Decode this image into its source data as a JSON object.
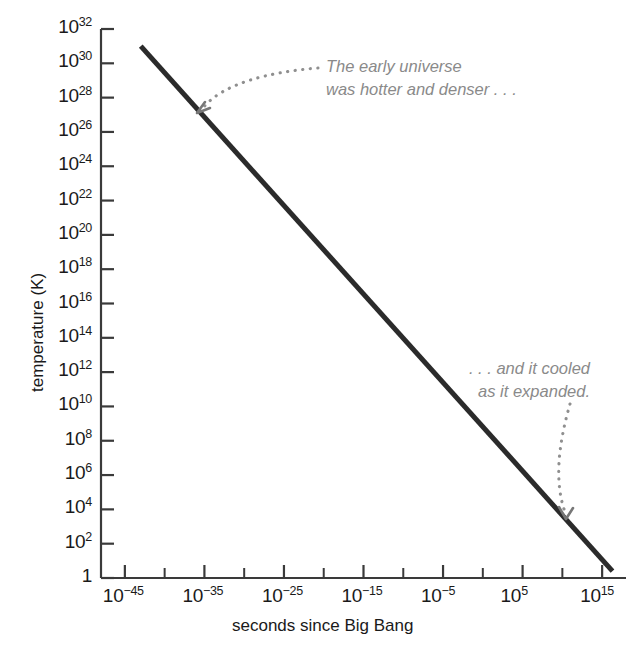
{
  "chart_data": {
    "type": "line",
    "title": "",
    "subtitle": "",
    "xlabel": "seconds since Big Bang",
    "ylabel": "temperature (K)",
    "xscale": "log",
    "yscale": "log",
    "grid": false,
    "legend": "none",
    "xlim_exponent": [
      -48,
      18
    ],
    "ylim_exponent": [
      0,
      32
    ],
    "x_tick_labels": [
      {
        "base": "10",
        "exp": "−45",
        "exponent_value": -45
      },
      {
        "base": "10",
        "exp": "−35",
        "exponent_value": -35
      },
      {
        "base": "10",
        "exp": "−25",
        "exponent_value": -25
      },
      {
        "base": "10",
        "exp": "−15",
        "exponent_value": -15
      },
      {
        "base": "10",
        "exp": "−5",
        "exponent_value": -5
      },
      {
        "base": "10",
        "exp": "5",
        "exponent_value": 5
      },
      {
        "base": "10",
        "exp": "15",
        "exponent_value": 15
      }
    ],
    "x_minor_tick_exponents": [
      -40,
      -30,
      -20,
      -10,
      0,
      10
    ],
    "y_tick_labels": [
      {
        "base": "10",
        "exp": "32",
        "exponent_value": 32
      },
      {
        "base": "10",
        "exp": "30",
        "exponent_value": 30
      },
      {
        "base": "10",
        "exp": "28",
        "exponent_value": 28
      },
      {
        "base": "10",
        "exp": "26",
        "exponent_value": 26
      },
      {
        "base": "10",
        "exp": "24",
        "exponent_value": 24
      },
      {
        "base": "10",
        "exp": "22",
        "exponent_value": 22
      },
      {
        "base": "10",
        "exp": "20",
        "exponent_value": 20
      },
      {
        "base": "10",
        "exp": "18",
        "exponent_value": 18
      },
      {
        "base": "10",
        "exp": "16",
        "exponent_value": 16
      },
      {
        "base": "10",
        "exp": "14",
        "exponent_value": 14
      },
      {
        "base": "10",
        "exp": "12",
        "exponent_value": 12
      },
      {
        "base": "10",
        "exp": "10",
        "exponent_value": 10
      },
      {
        "base": "10",
        "exp": "8",
        "exponent_value": 8
      },
      {
        "base": "10",
        "exp": "6",
        "exponent_value": 6
      },
      {
        "base": "10",
        "exp": "4",
        "exponent_value": 4
      },
      {
        "base": "10",
        "exp": "2",
        "exponent_value": 2
      },
      {
        "base": "1",
        "exp": "",
        "exponent_value": 0
      }
    ],
    "series": [
      {
        "name": "temperature vs time",
        "color": "#2b2b2b",
        "linewidth": 5,
        "points_log10": [
          {
            "x": -43.0,
            "y": 31.0
          },
          {
            "x": 16.3,
            "y": 0.4
          }
        ],
        "points_readable": [
          {
            "time_s": "1e-43",
            "temperature_K": "1e31"
          },
          {
            "time_s": "1e16",
            "temperature_K": "~2.5"
          }
        ]
      }
    ],
    "annotations": [
      {
        "id": "early-universe",
        "lines": [
          "The early universe",
          "was hotter and denser . . ."
        ],
        "text": "The early universe was hotter and denser . . .",
        "color": "#8a8a8a",
        "style": "italic",
        "arrow": "dotted-curved",
        "points_to_log10": {
          "x": -36.5,
          "y": 26.5
        }
      },
      {
        "id": "cooled-expanded",
        "lines": [
          ". . . and it cooled",
          "as it expanded."
        ],
        "text": ". . . and it cooled as it expanded.",
        "color": "#8a8a8a",
        "style": "italic",
        "arrow": "dotted-curved",
        "points_to_log10": {
          "x": 11.5,
          "y": 3.2
        }
      }
    ]
  },
  "axis_colors": {
    "axis_line": "#3a3a3a",
    "tick_label": "#1a1a1a",
    "data_line": "#2b2b2b",
    "annotation": "#8a8a8a",
    "background": "#ffffff"
  }
}
